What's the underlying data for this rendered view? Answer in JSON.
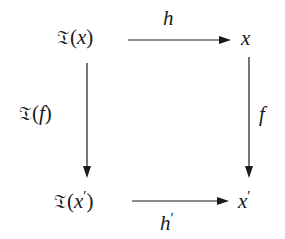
{
  "diagram": {
    "type": "commutative-square",
    "nodes": {
      "top_left": {
        "functor": "𝔗",
        "open": "(",
        "arg": "x",
        "prime": "",
        "close": ")"
      },
      "top_right": {
        "var": "x",
        "prime": ""
      },
      "bottom_left": {
        "functor": "𝔗",
        "open": "(",
        "arg": "x",
        "prime": "′",
        "close": ")"
      },
      "bottom_right": {
        "var": "x",
        "prime": "′"
      }
    },
    "arrows": {
      "top": {
        "from": "𝔗(x)",
        "to": "x",
        "label": "h",
        "label_prime": ""
      },
      "bottom": {
        "from": "𝔗(x′)",
        "to": "x′",
        "label": "h",
        "label_prime": "′"
      },
      "left": {
        "from": "𝔗(x)",
        "to": "𝔗(x′)",
        "functor": "𝔗",
        "open": "(",
        "label": "f",
        "close": ")"
      },
      "right": {
        "from": "x",
        "to": "x′",
        "label": "f"
      }
    },
    "colors": {
      "stroke": "#1a1a1a",
      "background": "#ffffff"
    }
  }
}
